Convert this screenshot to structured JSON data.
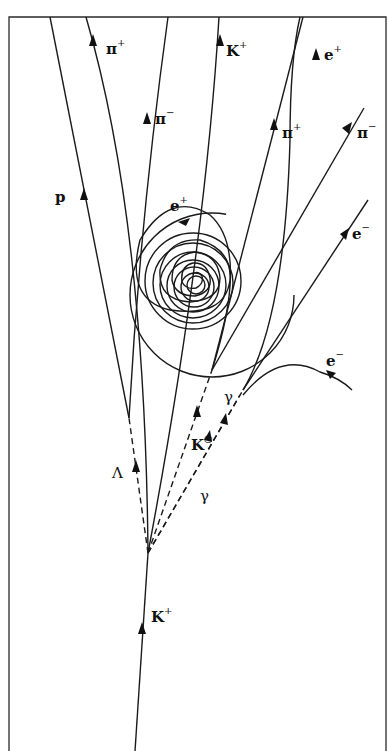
{
  "diagram": {
    "type": "bubble-chamber-event",
    "frame_color": "#2a2a2a",
    "labels": {
      "pi_plus_top": {
        "base": "π",
        "sup": "+"
      },
      "pi_minus_left": {
        "base": "π",
        "sup": "−"
      },
      "k_plus_top": {
        "base": "K",
        "sup": "+"
      },
      "e_plus_top": {
        "base": "e",
        "sup": "+"
      },
      "p": {
        "base": "p",
        "sup": ""
      },
      "e_plus_spiral": {
        "base": "e",
        "sup": "+"
      },
      "pi_plus_right": {
        "base": "π",
        "sup": "+"
      },
      "pi_minus_right": {
        "base": "π",
        "sup": "−"
      },
      "e_minus_upper": {
        "base": "e",
        "sup": "−"
      },
      "e_minus_lower": {
        "base": "e",
        "sup": "−"
      },
      "gamma_upper": {
        "base": "γ",
        "sup": ""
      },
      "k_zero": {
        "base": "K",
        "sup": "○"
      },
      "lambda": {
        "base": "Λ",
        "sup": ""
      },
      "gamma_lower": {
        "base": "γ",
        "sup": ""
      },
      "k_plus_incoming": {
        "base": "K",
        "sup": "+"
      }
    }
  }
}
